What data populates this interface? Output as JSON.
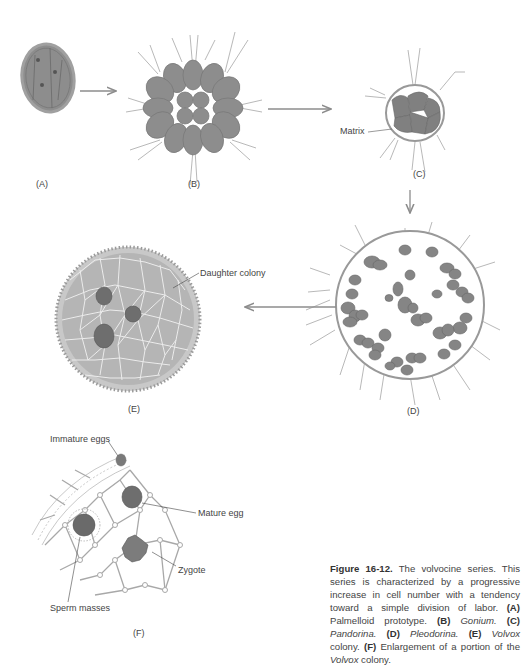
{
  "figure": {
    "panels": [
      {
        "id": "A",
        "label": "(A)"
      },
      {
        "id": "B",
        "label": "(B)"
      },
      {
        "id": "C",
        "label": "(C)"
      },
      {
        "id": "D",
        "label": "(D)"
      },
      {
        "id": "E",
        "label": "(E)"
      },
      {
        "id": "F",
        "label": "(F)"
      }
    ],
    "annotations": {
      "matrix": "Matrix",
      "daughter_colony": "Daughter colony",
      "immature_eggs": "Immature eggs",
      "mature_egg": "Mature egg",
      "zygote": "Zygote",
      "sperm_masses": "Sperm masses"
    },
    "caption": {
      "number": "Figure 16-12.",
      "text": "The volvocine series. This series is characterized by a progressive increase in cell number with a tendency toward a simple division of labor.",
      "items": [
        {
          "key": "(A)",
          "name": "Palmelloid prototype.",
          "italic": false
        },
        {
          "key": "(B)",
          "name": "Gonium.",
          "italic": true
        },
        {
          "key": "(C)",
          "name": "Pandorina.",
          "italic": true
        },
        {
          "key": "(D)",
          "name": "Pleodorina.",
          "italic": true
        },
        {
          "key": "(E)",
          "name": "Volvox",
          "suffix": " colony.",
          "italic": true
        },
        {
          "key": "(F)",
          "name": "Enlargement of a portion of the ",
          "suffix_italic": "Volvox",
          "suffix": " colony.",
          "italic": false
        }
      ]
    },
    "colors": {
      "cell": "#8a8a8a",
      "cell_dark": "#6e6e6e",
      "outline": "#9a9a9a",
      "arrow": "#8c8c8c",
      "text": "#444444"
    }
  }
}
